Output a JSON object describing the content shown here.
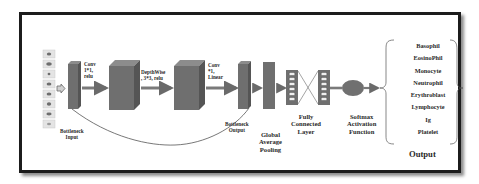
{
  "diagram": {
    "type": "cnn-architecture",
    "input": {
      "thumbnail_count": 8,
      "label_line1": "Bottleneck",
      "label_line2": "Input"
    },
    "stages": [
      {
        "id": "conv1",
        "line1": "Conv",
        "line2": "1*1,",
        "line3": "relu"
      },
      {
        "id": "depthwise",
        "line1": "DepthWise",
        "line2": ", 3*3, relu"
      },
      {
        "id": "conv2",
        "line1": "Conv",
        "line2": "*1,",
        "line3": "Linear"
      }
    ],
    "bottleneck_output": {
      "line1": "Bottleneck",
      "line2": "Output"
    },
    "gap": {
      "line1": "Global",
      "line2": "Average",
      "line3": "Pooling"
    },
    "fc": {
      "line1": "Fully",
      "line2": "Connected",
      "line3": "Layer",
      "nodes_per_layer": 6
    },
    "softmax": {
      "line1": "Softmax",
      "line2": "Activation",
      "line3": "Function"
    },
    "output": {
      "title": "Output",
      "classes": [
        "Basophil",
        "EosinoPhil",
        "Monocyte",
        "Neutrophil",
        "Erythroblast",
        "Lymphocyte",
        "Ig",
        "Platelet"
      ]
    },
    "colors": {
      "block_front": "#6f6f6f",
      "block_top": "#8c8c8c",
      "block_side": "#555555",
      "arrow": "#7a7a7a",
      "frame": "#1c1c1c",
      "text": "#2a2a2a"
    }
  }
}
